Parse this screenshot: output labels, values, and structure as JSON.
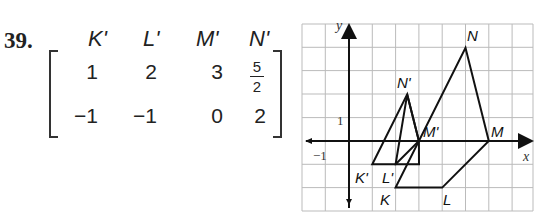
{
  "problem": {
    "number": "39.",
    "matrix": {
      "column_headers": [
        "K'",
        "L'",
        "M'",
        "N'"
      ],
      "row1": [
        "1",
        "2",
        "3"
      ],
      "row1_fraction": {
        "numerator": "5",
        "denominator": "2"
      },
      "row2": [
        "−1",
        "−1",
        "0",
        "2"
      ]
    }
  },
  "graph": {
    "axis_labels": {
      "x": "x",
      "y": "y"
    },
    "tick_labels": {
      "y_one": "1",
      "x_neg_one": "−1"
    },
    "preimage": {
      "K": [
        2,
        -2
      ],
      "L": [
        4,
        -2
      ],
      "M": [
        6,
        0
      ],
      "N": [
        5,
        4
      ]
    },
    "image": {
      "K'": [
        1,
        -1
      ],
      "L'": [
        2,
        -1
      ],
      "M'": [
        3,
        0
      ],
      "N'": [
        2.5,
        2
      ]
    },
    "point_labels": {
      "K": "K",
      "L": "L",
      "M": "M",
      "N": "N",
      "Kp": "K'",
      "Lp": "L'",
      "Mp": "M'",
      "Np": "N'"
    }
  }
}
